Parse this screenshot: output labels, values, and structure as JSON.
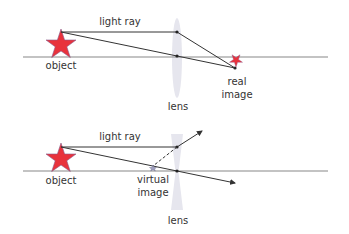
{
  "colors": {
    "star_fill": "#e8323c",
    "star_stroke": "#8a5a8a",
    "ray": "#333333",
    "axis": "#888888",
    "lens": "#e6e6ee",
    "text": "#333333"
  },
  "top_diagram": {
    "title": "Converging lens forming a real image",
    "ray_label": "light ray",
    "object_label": "object",
    "lens_label": "lens",
    "image_label_line1": "real",
    "image_label_line2": "image"
  },
  "bottom_diagram": {
    "title": "Diverging lens forming a virtual image",
    "ray_label": "light ray",
    "object_label": "object",
    "lens_label": "lens",
    "image_label_line1": "virtual",
    "image_label_line2": "image"
  }
}
